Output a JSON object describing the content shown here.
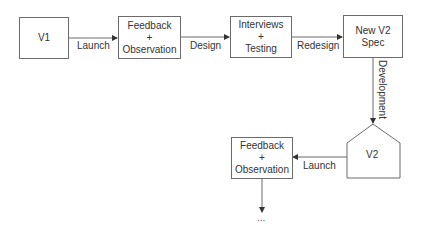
{
  "diagram": {
    "nodes": {
      "v1": {
        "label": "V1"
      },
      "feedback1": {
        "line1": "Feedback",
        "line2": "+",
        "line3": "Observation"
      },
      "interviews": {
        "line1": "Interviews",
        "line2": "+",
        "line3": "Testing"
      },
      "spec": {
        "line1": "New V2",
        "line2": "Spec"
      },
      "v2": {
        "label": "V2"
      },
      "feedback2": {
        "line1": "Feedback",
        "line2": "+",
        "line3": "Observation"
      },
      "continuation": {
        "label": "..."
      }
    },
    "edges": {
      "launch1": "Launch",
      "design": "Design",
      "redesign": "Redesign",
      "development": "Development",
      "launch2": "Launch"
    },
    "colors": {
      "stroke": "#6b6b6b",
      "arrow": "#333333",
      "text": "#333333"
    }
  }
}
